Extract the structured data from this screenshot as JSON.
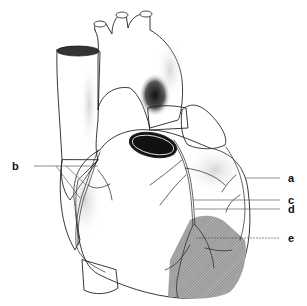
{
  "figure": {
    "labels": [
      {
        "id": "a",
        "text": "a"
      },
      {
        "id": "b",
        "text": "b"
      },
      {
        "id": "c",
        "text": "c"
      },
      {
        "id": "d",
        "text": "d"
      },
      {
        "id": "e",
        "text": "e"
      }
    ],
    "colors": {
      "ink": "#222222",
      "shade": "#8a8a8a",
      "lumen": "#111111",
      "background": "#ffffff"
    }
  }
}
